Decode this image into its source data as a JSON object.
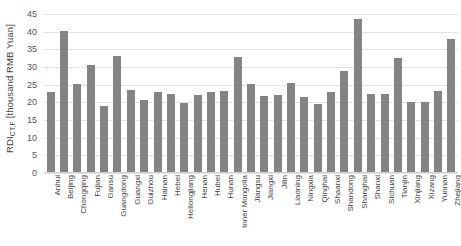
{
  "chart_data": {
    "type": "bar",
    "title": "",
    "subtitle": "",
    "xlabel": "",
    "ylabel": "RDI_CT,F [thousand RMB Yuan]",
    "ylabel_main": "RDI",
    "ylabel_sub": "CT,F",
    "ylabel_unit": " [thousand RMB Yuan]",
    "ylim": [
      0,
      45
    ],
    "ytick_values": [
      0,
      5,
      10,
      15,
      20,
      25,
      30,
      35,
      40,
      45
    ],
    "ytick_labels": [
      "0",
      "5",
      "10",
      "15",
      "20",
      "25",
      "30",
      "35",
      "40",
      "45"
    ],
    "grid": true,
    "grid_axis": "y",
    "legend": false,
    "legend_position": "none",
    "bar_color": "#848484",
    "gridline_color": "#e2e2e2",
    "categories": [
      "Anhui",
      "Beijing",
      "Chongqing",
      "Fujian",
      "Gansu",
      "Guangdong",
      "Guangxi",
      "Guizhou",
      "Hainan",
      "Hebei",
      "Heilongjiang",
      "Henan",
      "Hubei",
      "Hunan",
      "Inner Mongolia",
      "Jiangsu",
      "Jiangxi",
      "Jilin",
      "Liaoning",
      "Ningxia",
      "Qinghai",
      "Shaanxi",
      "Shandong",
      "Shanghai",
      "Shanxi",
      "Sichuan",
      "Tianjin",
      "Xinjiang",
      "Xizang",
      "Yunnan",
      "Zhejiang"
    ],
    "values": [
      23.0,
      40.3,
      25.2,
      30.7,
      18.9,
      33.0,
      23.4,
      20.7,
      22.9,
      22.5,
      19.8,
      22.2,
      22.8,
      23.3,
      32.7,
      25.2,
      21.7,
      22.1,
      25.4,
      21.5,
      19.6,
      22.8,
      29.0,
      43.6,
      22.4,
      22.3,
      32.6,
      20.0,
      20.1,
      23.1,
      37.9
    ]
  }
}
